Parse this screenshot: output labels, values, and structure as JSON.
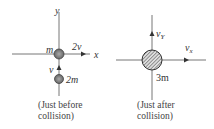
{
  "diagram": {
    "before": {
      "axis_labels": {
        "y": "y",
        "x": "x"
      },
      "mass_top": "m",
      "mass_top_velocity": "2v",
      "mass_bottom": "2m",
      "mass_bottom_velocity": "v",
      "caption_line1": "(Just before",
      "caption_line2": "collision)"
    },
    "after": {
      "combined_mass": "3m",
      "velocity_y": "v",
      "velocity_y_sub": "Y",
      "velocity_x": "v",
      "velocity_x_sub": "x",
      "caption_line1": "(Just after",
      "caption_line2": "collision)"
    },
    "colors": {
      "axis": "#666666",
      "ball_fill": "#888888",
      "text": "#333333"
    }
  }
}
